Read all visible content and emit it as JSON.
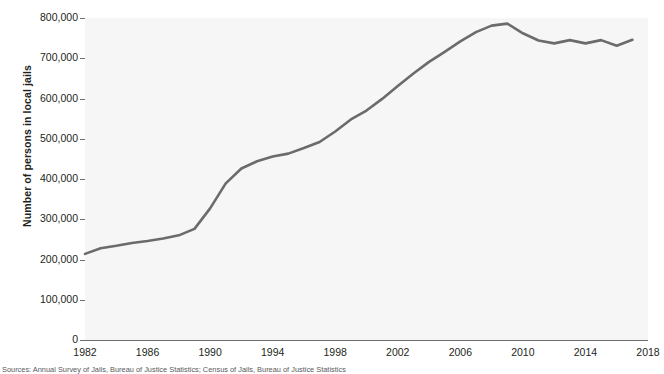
{
  "figure": {
    "ylabel": "Number of persons in local jails",
    "caption": "Sources: Annual Survey of Jails, Bureau of Justice Statistics; Census of Jails, Bureau of Justice Statistics"
  },
  "axes": {
    "y_ticks": [
      {
        "value": 0,
        "label": "0"
      },
      {
        "value": 100000,
        "label": "100,000"
      },
      {
        "value": 200000,
        "label": "200,000"
      },
      {
        "value": 300000,
        "label": "300,000"
      },
      {
        "value": 400000,
        "label": "400,000"
      },
      {
        "value": 500000,
        "label": "500,000"
      },
      {
        "value": 600000,
        "label": "600,000"
      },
      {
        "value": 700000,
        "label": "700,000"
      },
      {
        "value": 800000,
        "label": "800,000"
      }
    ],
    "x_ticks": [
      {
        "value": 1982,
        "label": "1982"
      },
      {
        "value": 1986,
        "label": "1986"
      },
      {
        "value": 1990,
        "label": "1990"
      },
      {
        "value": 1994,
        "label": "1994"
      },
      {
        "value": 1998,
        "label": "1998"
      },
      {
        "value": 2002,
        "label": "2002"
      },
      {
        "value": 2006,
        "label": "2006"
      },
      {
        "value": 2010,
        "label": "2010"
      },
      {
        "value": 2014,
        "label": "2014"
      },
      {
        "value": 2018,
        "label": "2018"
      }
    ]
  },
  "style": {
    "line_color": "#6b6b6b",
    "line_width": 2.6,
    "plot_background": "#f6f6f6",
    "page_background": "#ffffff",
    "axis_color": "#6d6e71",
    "text_color": "#231f20"
  },
  "chart_data": {
    "type": "line",
    "title": "",
    "xlabel": "",
    "ylabel": "Number of persons in local jails",
    "xlim": [
      1982,
      2018
    ],
    "ylim": [
      0,
      800000
    ],
    "grid": false,
    "legend": null,
    "x": [
      1982,
      1983,
      1984,
      1985,
      1986,
      1987,
      1988,
      1989,
      1990,
      1991,
      1992,
      1993,
      1994,
      1995,
      1996,
      1997,
      1998,
      1999,
      2000,
      2001,
      2002,
      2003,
      2004,
      2005,
      2006,
      2007,
      2008,
      2009,
      2010,
      2011,
      2012,
      2013,
      2014,
      2015,
      2016,
      2017
    ],
    "series": [
      {
        "name": "Persons in local jails",
        "values": [
          214000,
          228000,
          234000,
          241000,
          246000,
          252000,
          260000,
          276000,
          327000,
          389000,
          426000,
          444000,
          456000,
          463000,
          477000,
          492000,
          518000,
          548000,
          570000,
          599000,
          631000,
          662000,
          691000,
          716000,
          742000,
          765000,
          781000,
          786000,
          762000,
          744000,
          737000,
          745000,
          737000,
          745000,
          731000,
          746000
        ]
      }
    ],
    "annotations": [
      {
        "text": "Peak near 2009 at about 786,000",
        "x": 2009,
        "y": 786000
      },
      {
        "text": "Start 1982 at about 214,000",
        "x": 1982,
        "y": 214000
      }
    ]
  }
}
